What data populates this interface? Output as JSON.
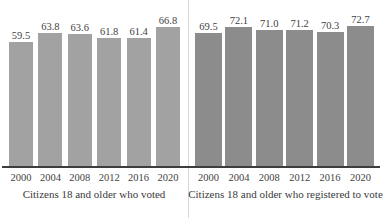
{
  "chart_data": [
    {
      "type": "bar",
      "title": "",
      "xlabel": "Citizens 18 and older who voted",
      "ylabel": "",
      "categories": [
        "2000",
        "2004",
        "2008",
        "2012",
        "2016",
        "2020"
      ],
      "values": [
        59.5,
        63.8,
        63.6,
        61.8,
        61.4,
        66.8
      ],
      "value_labels": [
        "59.5",
        "63.8",
        "63.6",
        "61.8",
        "61.4",
        "66.8"
      ],
      "ylim": [
        0,
        74
      ],
      "grid": false,
      "legend": "none",
      "bar_color": "#a2a2a2"
    },
    {
      "type": "bar",
      "title": "",
      "xlabel": "Citizens 18 and older who registered to vote",
      "ylabel": "",
      "categories": [
        "2000",
        "2004",
        "2008",
        "2012",
        "2016",
        "2020"
      ],
      "values": [
        69.5,
        72.1,
        71.0,
        71.2,
        70.3,
        72.7
      ],
      "value_labels": [
        "69.5",
        "72.1",
        "71.0",
        "71.2",
        "70.3",
        "72.7"
      ],
      "ylim": [
        0,
        74
      ],
      "grid": false,
      "legend": "none",
      "bar_color": "#8c8c8c"
    }
  ],
  "panels": [
    {
      "caption": "Citizens 18 and older who voted",
      "years": [
        "2000",
        "2004",
        "2008",
        "2012",
        "2016",
        "2020"
      ],
      "labels": [
        "59.5",
        "63.8",
        "63.6",
        "61.8",
        "61.4",
        "66.8"
      ],
      "heights": [
        124,
        133,
        132.5,
        128.5,
        128,
        139
      ]
    },
    {
      "caption": "Citizens 18 and older who registered to vote",
      "years": [
        "2000",
        "2004",
        "2008",
        "2012",
        "2016",
        "2020"
      ],
      "labels": [
        "69.5",
        "72.1",
        "71.0",
        "71.2",
        "70.3",
        "72.7"
      ],
      "heights": [
        133,
        139,
        136,
        136.5,
        134.5,
        140
      ]
    }
  ],
  "colors": {
    "bar_left": "#a2a2a2",
    "bar_right": "#8c8c8c",
    "axis": "#3d3d3d",
    "text": "#3a3a3a",
    "divider": "#d8d8d8",
    "background": "#ffffff"
  }
}
